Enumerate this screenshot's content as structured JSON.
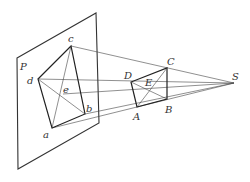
{
  "diagram": {
    "plane_label": "P",
    "labels": {
      "P": "P",
      "a": "a",
      "b": "b",
      "c": "c",
      "d": "d",
      "e": "e",
      "A": "A",
      "B": "B",
      "C": "C",
      "D": "D",
      "E": "E",
      "S": "S"
    },
    "points": {
      "S": [
        234,
        83
      ],
      "A": [
        137,
        107
      ],
      "B": [
        167,
        99
      ],
      "C": [
        167,
        68
      ],
      "D": [
        131,
        82
      ],
      "E": [
        149,
        88
      ],
      "a": [
        52,
        128
      ],
      "b": [
        85,
        114
      ],
      "c": [
        71,
        46
      ],
      "d": [
        38,
        79
      ],
      "e": [
        63,
        94
      ]
    },
    "plane": [
      [
        17,
        58
      ],
      [
        96,
        13
      ],
      [
        99,
        123
      ],
      [
        18,
        169
      ]
    ],
    "colors": {
      "stroke": "#333333",
      "background": "#ffffff"
    }
  }
}
